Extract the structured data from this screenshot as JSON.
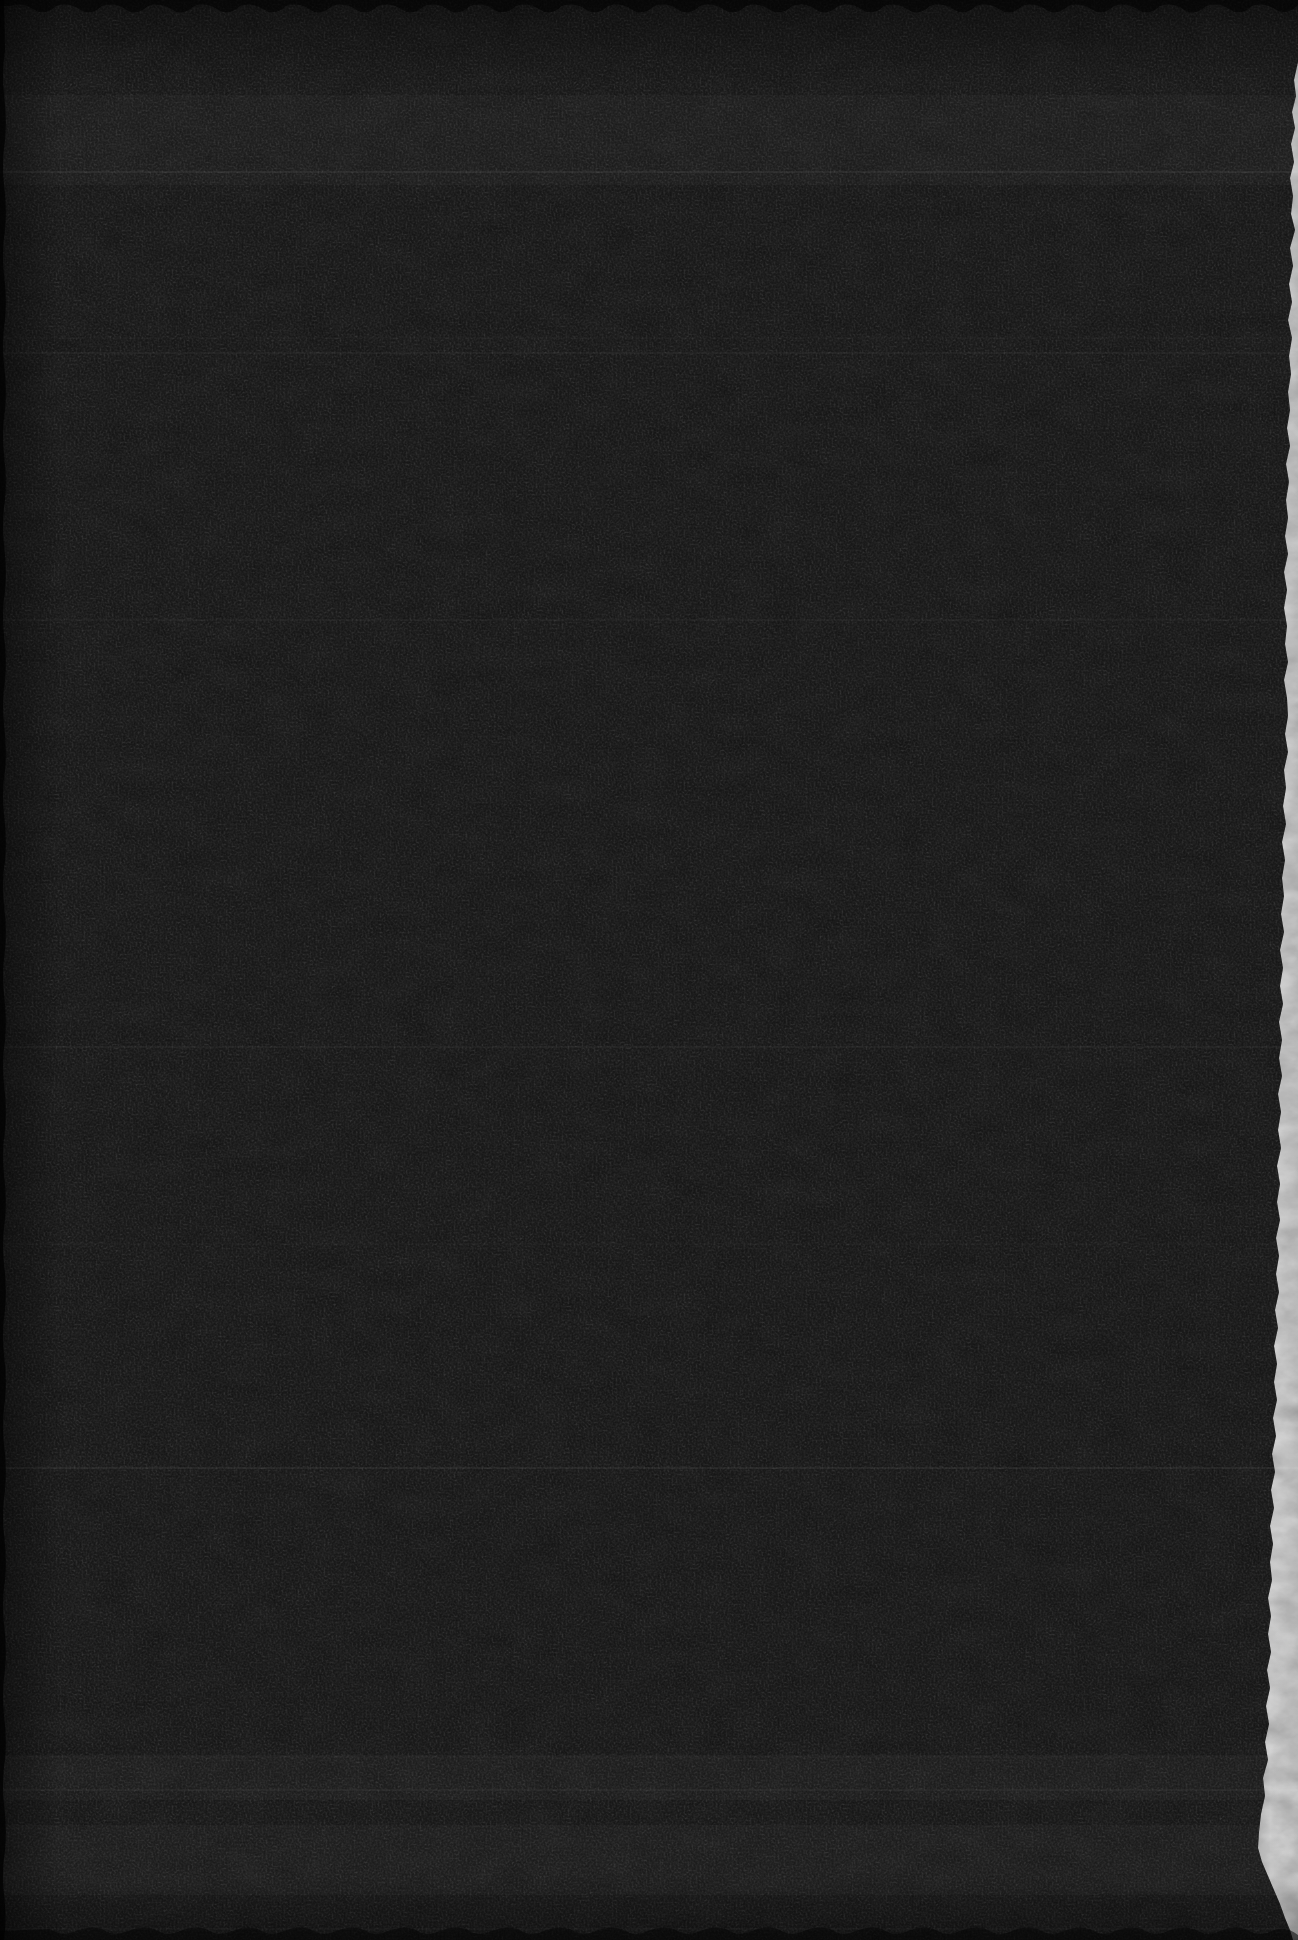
{
  "document": {
    "type": "book-scan",
    "page_state": "blank",
    "description": "Scanned blank black page (dark endpaper of a book). No text, figures, or UI controls are visible; only dark paper grain, faint horizontal scan streaks, darker scalloped page edges, and a torn white deckle edge along the right side.",
    "colors": {
      "scanner_background": "#040404",
      "page_base": "#262626",
      "page_apparent": "#1b1b1b",
      "deckle_edge": "#cfcfcf",
      "deckle_edge_bright": "#dedede",
      "deckle_edge_dim": "#aeaeae",
      "edge_shadow": "#020202",
      "streak": "#ffffff"
    },
    "texture": {
      "grain": "paper-grain-noise",
      "streak_lines_y": [
        172,
        338,
        353,
        620,
        1047,
        1244,
        1468,
        1757,
        1790,
        1929
      ],
      "light_bands": [
        [
          95,
          185
        ],
        [
          1755,
          1800
        ],
        [
          1825,
          1895
        ]
      ]
    }
  }
}
